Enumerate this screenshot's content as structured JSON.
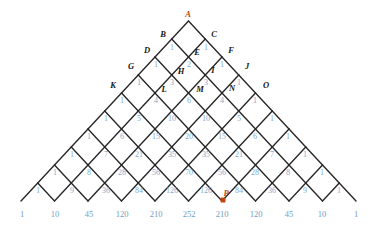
{
  "figure": {
    "type": "pascal-triangle-lattice",
    "apex_label": "A",
    "marked_point_label": "P",
    "accent_color": "#c1440e",
    "number_color": "#7fa9cf",
    "line_color": "#262626",
    "rows": 10,
    "vertex_labels": [
      {
        "text": "A",
        "x": 188,
        "y": 14,
        "accent": true
      },
      {
        "text": "B",
        "x": 163,
        "y": 34,
        "accent": false
      },
      {
        "text": "C",
        "x": 214,
        "y": 34,
        "accent": false
      },
      {
        "text": "D",
        "x": 147,
        "y": 50,
        "accent": false
      },
      {
        "text": "E",
        "x": 197,
        "y": 52,
        "accent": false
      },
      {
        "text": "F",
        "x": 231,
        "y": 50,
        "accent": false
      },
      {
        "text": "G",
        "x": 131,
        "y": 66,
        "accent": false
      },
      {
        "text": "H",
        "x": 181,
        "y": 71,
        "accent": false
      },
      {
        "text": "I",
        "x": 213,
        "y": 70,
        "accent": false
      },
      {
        "text": "J",
        "x": 247,
        "y": 66,
        "accent": false
      },
      {
        "text": "K",
        "x": 113,
        "y": 85,
        "accent": false
      },
      {
        "text": "L",
        "x": 164,
        "y": 89,
        "accent": false
      },
      {
        "text": "M",
        "x": 200,
        "y": 89,
        "accent": false
      },
      {
        "text": "N",
        "x": 232,
        "y": 88,
        "accent": false
      },
      {
        "text": "O",
        "x": 266,
        "y": 85,
        "accent": false
      },
      {
        "text": "P",
        "x": 226,
        "y": 193,
        "accent": true
      }
    ],
    "marked_point": {
      "x": 223,
      "y": 200
    },
    "cell_numbers": [
      {
        "v": "1",
        "x": 172,
        "y": 48
      },
      {
        "v": "1",
        "x": 206,
        "y": 48
      },
      {
        "v": "1",
        "x": 156,
        "y": 65
      },
      {
        "v": "2",
        "x": 189,
        "y": 65
      },
      {
        "v": "1",
        "x": 222,
        "y": 65
      },
      {
        "v": "1",
        "x": 139,
        "y": 83
      },
      {
        "v": "3",
        "x": 172,
        "y": 83
      },
      {
        "v": "3",
        "x": 206,
        "y": 83
      },
      {
        "v": "1",
        "x": 239,
        "y": 83
      },
      {
        "v": "1",
        "x": 122,
        "y": 101
      },
      {
        "v": "4",
        "x": 156,
        "y": 101
      },
      {
        "v": "6",
        "x": 189,
        "y": 101
      },
      {
        "v": "4",
        "x": 222,
        "y": 101
      },
      {
        "v": "1",
        "x": 255,
        "y": 101
      },
      {
        "v": "1",
        "x": 106,
        "y": 119
      },
      {
        "v": "5",
        "x": 139,
        "y": 119
      },
      {
        "v": "10",
        "x": 172,
        "y": 119
      },
      {
        "v": "10",
        "x": 206,
        "y": 119
      },
      {
        "v": "5",
        "x": 239,
        "y": 119
      },
      {
        "v": "1",
        "x": 272,
        "y": 119
      },
      {
        "v": "1",
        "x": 89,
        "y": 137
      },
      {
        "v": "6",
        "x": 122,
        "y": 137
      },
      {
        "v": "15",
        "x": 156,
        "y": 137
      },
      {
        "v": "20",
        "x": 189,
        "y": 137
      },
      {
        "v": "15",
        "x": 222,
        "y": 137
      },
      {
        "v": "6",
        "x": 255,
        "y": 137
      },
      {
        "v": "1",
        "x": 288,
        "y": 137
      },
      {
        "v": "1",
        "x": 72,
        "y": 155
      },
      {
        "v": "7",
        "x": 106,
        "y": 155
      },
      {
        "v": "21",
        "x": 139,
        "y": 155
      },
      {
        "v": "35",
        "x": 172,
        "y": 155
      },
      {
        "v": "35",
        "x": 206,
        "y": 155
      },
      {
        "v": "21",
        "x": 239,
        "y": 155
      },
      {
        "v": "7",
        "x": 272,
        "y": 155
      },
      {
        "v": "1",
        "x": 305,
        "y": 155
      },
      {
        "v": "1",
        "x": 55,
        "y": 173
      },
      {
        "v": "8",
        "x": 89,
        "y": 173
      },
      {
        "v": "28",
        "x": 122,
        "y": 173
      },
      {
        "v": "56",
        "x": 156,
        "y": 173
      },
      {
        "v": "70",
        "x": 189,
        "y": 173
      },
      {
        "v": "56",
        "x": 222,
        "y": 173
      },
      {
        "v": "28",
        "x": 255,
        "y": 173
      },
      {
        "v": "8",
        "x": 288,
        "y": 173
      },
      {
        "v": "1",
        "x": 322,
        "y": 173
      },
      {
        "v": "1",
        "x": 38,
        "y": 191
      },
      {
        "v": "9",
        "x": 72,
        "y": 191
      },
      {
        "v": "36",
        "x": 106,
        "y": 191
      },
      {
        "v": "84",
        "x": 139,
        "y": 191
      },
      {
        "v": "126",
        "x": 172,
        "y": 191
      },
      {
        "v": "126",
        "x": 206,
        "y": 191
      },
      {
        "v": "84",
        "x": 239,
        "y": 191
      },
      {
        "v": "36",
        "x": 272,
        "y": 191
      },
      {
        "v": "9",
        "x": 305,
        "y": 191
      },
      {
        "v": "1",
        "x": 339,
        "y": 191
      }
    ],
    "base_numbers": [
      {
        "v": "1",
        "x": 22,
        "y": 214
      },
      {
        "v": "10",
        "x": 55,
        "y": 214
      },
      {
        "v": "45",
        "x": 89,
        "y": 214
      },
      {
        "v": "120",
        "x": 122,
        "y": 214
      },
      {
        "v": "210",
        "x": 156,
        "y": 214
      },
      {
        "v": "252",
        "x": 189,
        "y": 214
      },
      {
        "v": "210",
        "x": 222,
        "y": 214
      },
      {
        "v": "120",
        "x": 256,
        "y": 214
      },
      {
        "v": "45",
        "x": 289,
        "y": 214
      },
      {
        "v": "10",
        "x": 322,
        "y": 214
      },
      {
        "v": "1",
        "x": 356,
        "y": 214
      }
    ]
  },
  "chart_data": {
    "type": "diagram",
    "apex": "A",
    "marked_point": "P",
    "pascal_rows": [
      [
        1
      ],
      [
        1,
        1
      ],
      [
        1,
        2,
        1
      ],
      [
        1,
        3,
        3,
        1
      ],
      [
        1,
        4,
        6,
        4,
        1
      ],
      [
        1,
        5,
        10,
        10,
        5,
        1
      ],
      [
        1,
        6,
        15,
        20,
        15,
        6,
        1
      ],
      [
        1,
        7,
        21,
        35,
        35,
        21,
        7,
        1
      ],
      [
        1,
        8,
        28,
        56,
        70,
        56,
        28,
        8,
        1
      ],
      [
        1,
        9,
        36,
        84,
        126,
        126,
        84,
        36,
        9,
        1
      ],
      [
        1,
        10,
        45,
        120,
        210,
        252,
        210,
        120,
        45,
        10,
        1
      ]
    ],
    "labels": [
      "A",
      "B",
      "C",
      "D",
      "E",
      "F",
      "G",
      "H",
      "I",
      "J",
      "K",
      "L",
      "M",
      "N",
      "O",
      "P"
    ]
  }
}
